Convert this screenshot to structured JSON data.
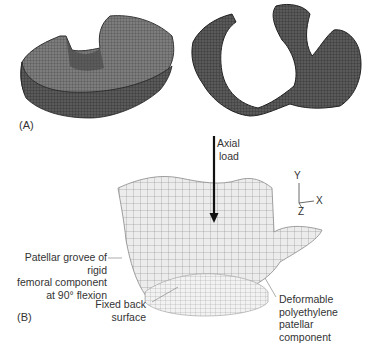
{
  "figure": {
    "panel_a": {
      "label": "(A)",
      "parts": [
        {
          "name": "patellar-component-mesh",
          "description": "Finite element mesh of patellar component"
        },
        {
          "name": "femoral-component-mesh",
          "description": "Finite element mesh of femoral component"
        }
      ]
    },
    "panel_b": {
      "label": "(B)",
      "load_label_line1": "Axial",
      "load_label_line2": "load",
      "axes": {
        "y": "Y",
        "x": "X",
        "z": "Z"
      },
      "annotations": {
        "groove_line1": "Patellar grovee of rigid",
        "groove_line2": "femoral component",
        "groove_line3": "at 90° flexion",
        "fixed_line1": "Fixed back",
        "fixed_line2": "surface",
        "deformable_line1": "Deformable",
        "deformable_line2": "polyethylene patellar",
        "deformable_line3": "component"
      }
    },
    "colors": {
      "mesh_dark": "#3a3a3a",
      "mesh_light": "#e6e6e6",
      "mesh_line": "#8a8a8a",
      "text": "#333333"
    }
  }
}
